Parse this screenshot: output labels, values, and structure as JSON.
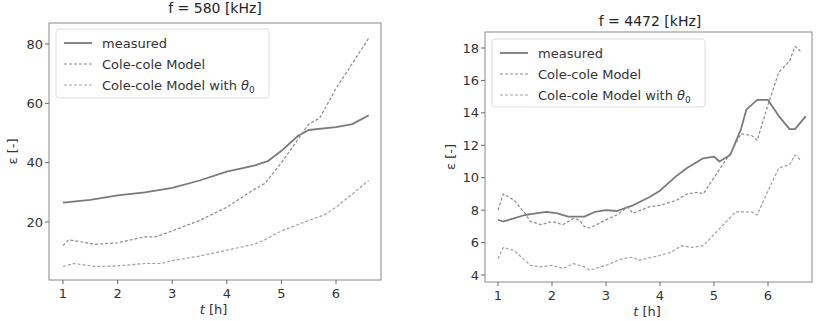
{
  "chart_data": [
    {
      "type": "line",
      "title": "f = 580 [kHz]",
      "xlabel": "t [h]",
      "ylabel": "ε [-]",
      "xlim": [
        0.75,
        6.85
      ],
      "ylim": [
        1,
        87
      ],
      "xticks": [
        1,
        2,
        3,
        4,
        5,
        6
      ],
      "yticks": [
        20,
        40,
        60,
        80
      ],
      "grid": false,
      "legend_position": "upper left",
      "series": [
        {
          "name": "measured",
          "style": "solid",
          "color": "#7a7a7a",
          "x": [
            1,
            1.5,
            2,
            2.5,
            3,
            3.5,
            4,
            4.5,
            4.75,
            5,
            5.3,
            5.5,
            6,
            6.3,
            6.6
          ],
          "y": [
            26.5,
            27.5,
            29,
            30,
            31.5,
            34,
            37,
            39,
            40.5,
            44,
            49,
            51,
            52,
            53,
            56
          ]
        },
        {
          "name": "Cole-cole Model",
          "style": "dashed",
          "color": "#8a8a8a",
          "x": [
            1,
            1.1,
            1.6,
            2,
            2.5,
            2.7,
            3,
            3.5,
            4,
            4.5,
            4.7,
            5,
            5.5,
            5.7,
            6,
            6.6
          ],
          "y": [
            12,
            14,
            12.5,
            13,
            15,
            15,
            17,
            20.5,
            25,
            31,
            33,
            40,
            53,
            55,
            65,
            82
          ]
        },
        {
          "name": "Cole-cole Model with θ0",
          "style": "dashed",
          "color": "#a0a0a0",
          "x": [
            1,
            1.2,
            1.6,
            2,
            2.5,
            2.8,
            3,
            3.5,
            4,
            4.5,
            4.7,
            5,
            5.5,
            5.8,
            6,
            6.6
          ],
          "y": [
            5,
            6,
            5,
            5.2,
            6,
            6,
            7,
            8.5,
            10.5,
            12.5,
            14,
            17,
            20.5,
            22.5,
            25,
            34
          ]
        }
      ]
    },
    {
      "type": "line",
      "title": "f = 4472 [kHz]",
      "xlabel": "t [h]",
      "ylabel": "ε [-]",
      "xlim": [
        0.75,
        6.8
      ],
      "ylim": [
        3.6,
        19
      ],
      "xticks": [
        1,
        2,
        3,
        4,
        5,
        6
      ],
      "yticks": [
        4,
        6,
        8,
        10,
        12,
        14,
        16,
        18
      ],
      "grid": false,
      "legend_position": "upper left",
      "series": [
        {
          "name": "measured",
          "style": "solid",
          "color": "#7a7a7a",
          "x": [
            1,
            1.1,
            1.2,
            1.5,
            1.7,
            1.9,
            2.1,
            2.3,
            2.6,
            2.8,
            3,
            3.2,
            3.5,
            3.8,
            4,
            4.3,
            4.5,
            4.8,
            5,
            5.1,
            5.3,
            5.5,
            5.6,
            5.8,
            6,
            6.2,
            6.4,
            6.5,
            6.7
          ],
          "y": [
            7.4,
            7.3,
            7.4,
            7.7,
            7.8,
            7.9,
            7.8,
            7.6,
            7.6,
            7.9,
            8.0,
            7.95,
            8.3,
            8.8,
            9.2,
            10.1,
            10.6,
            11.2,
            11.3,
            11.0,
            11.4,
            13.0,
            14.2,
            14.8,
            14.8,
            13.8,
            13.0,
            13.0,
            13.8
          ]
        },
        {
          "name": "Cole-cole Model",
          "style": "dashed",
          "color": "#8a8a8a",
          "x": [
            1,
            1.1,
            1.3,
            1.5,
            1.6,
            1.8,
            2,
            2.2,
            2.4,
            2.5,
            2.6,
            2.7,
            3,
            3.2,
            3.4,
            3.5,
            3.8,
            4,
            4.3,
            4.5,
            4.7,
            4.8,
            5,
            5.3,
            5.5,
            5.7,
            5.8,
            6,
            6.2,
            6.4,
            6.5,
            6.6
          ],
          "y": [
            8.0,
            9.0,
            8.6,
            7.8,
            7.3,
            7.1,
            7.3,
            7.1,
            7.5,
            7.4,
            7.0,
            6.9,
            7.4,
            7.7,
            8.2,
            7.8,
            8.2,
            8.3,
            8.6,
            9.0,
            9.1,
            9.0,
            10.0,
            11.5,
            12.7,
            12.6,
            12.3,
            14.5,
            16.5,
            17.2,
            18.1,
            17.8
          ]
        },
        {
          "name": "Cole-cole Model with θ0",
          "style": "dashed",
          "color": "#a0a0a0",
          "x": [
            1,
            1.1,
            1.3,
            1.6,
            1.8,
            2,
            2.2,
            2.4,
            2.6,
            2.7,
            3,
            3.3,
            3.5,
            3.6,
            4,
            4.2,
            4.4,
            4.6,
            4.8,
            5,
            5.2,
            5.4,
            5.7,
            5.8,
            6,
            6.2,
            6.4,
            6.5,
            6.6
          ],
          "y": [
            5.0,
            5.7,
            5.5,
            4.6,
            4.5,
            4.6,
            4.4,
            4.7,
            4.5,
            4.3,
            4.6,
            5.0,
            5.1,
            4.9,
            5.2,
            5.4,
            5.8,
            5.7,
            5.8,
            6.5,
            7.2,
            7.9,
            7.9,
            7.7,
            9.2,
            10.6,
            10.8,
            11.4,
            11.1
          ]
        }
      ]
    }
  ],
  "charts": [
    {
      "title": "f = 580 [kHz]",
      "xlabel_var": "t",
      "xlabel_unit": " [h]",
      "ylabel": "ε [-]",
      "legend": [
        "measured",
        "Cole-cole Model",
        "Cole-cole Model with θ"
      ],
      "legend_sub": "0"
    },
    {
      "title": "f = 4472 [kHz]",
      "xlabel_var": "t",
      "xlabel_unit": " [h]",
      "ylabel": "ε [-]",
      "legend": [
        "measured",
        "Cole-cole Model",
        "Cole-cole Model with θ"
      ],
      "legend_sub": "0"
    }
  ],
  "layout": [
    {
      "box": {
        "left": 49,
        "right": 381,
        "top": 23,
        "bottom": 280
      },
      "x_px": [
        63,
        336
      ],
      "x_val": [
        1,
        6
      ],
      "y_px": [
        222,
        44
      ],
      "y_val": [
        20,
        80
      ],
      "title_x": 215,
      "title_y": 13,
      "legend": {
        "x": 56,
        "y": 29,
        "w": 213,
        "h": 69
      },
      "ylabel_x": 17
    },
    {
      "box": {
        "left": 485,
        "right": 812,
        "top": 32,
        "bottom": 282
      },
      "x_px": [
        498,
        768
      ],
      "x_val": [
        1,
        6
      ],
      "y_px": [
        275,
        48
      ],
      "y_val": [
        4,
        18
      ],
      "title_x": 650,
      "title_y": 26,
      "legend": {
        "x": 492,
        "y": 39,
        "w": 213,
        "h": 68
      },
      "ylabel_x": 455
    }
  ]
}
